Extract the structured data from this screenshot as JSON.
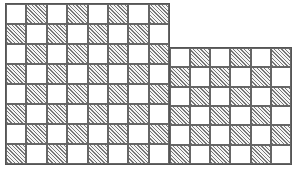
{
  "figure": {
    "line_color": "#555555",
    "hatch_color": "#777777",
    "blocks": [
      {
        "id": "left",
        "x": 5,
        "y": 3,
        "width": 165,
        "height": 162,
        "rows": 8,
        "cols": 8,
        "first_cell_hatched": false
      },
      {
        "id": "right",
        "x": 169,
        "y": 47,
        "width": 123,
        "height": 118,
        "rows": 6,
        "cols": 6,
        "first_cell_hatched": false
      }
    ]
  }
}
